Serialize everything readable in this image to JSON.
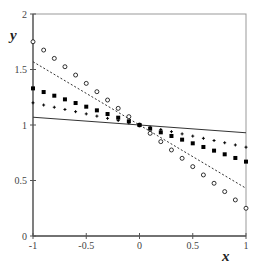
{
  "chart_data": {
    "type": "scatter",
    "title": "",
    "xlabel": "x",
    "ylabel": "y",
    "xlim": [
      -1,
      1
    ],
    "ylim": [
      0,
      2
    ],
    "grid": false,
    "legend": null,
    "x_ticks": [
      -1,
      -0.5,
      0,
      0.5,
      1
    ],
    "x_tick_labels": [
      "-1",
      "-0.5",
      "0",
      "0.5",
      "1"
    ],
    "y_ticks": [
      0,
      0.5,
      1,
      1.5,
      2
    ],
    "y_tick_labels": [
      "0",
      "0.5",
      "1",
      "1.5",
      "2"
    ],
    "x": [
      -1,
      -0.9,
      -0.8,
      -0.7,
      -0.6,
      -0.5,
      -0.4,
      -0.3,
      -0.2,
      -0.1,
      0,
      0.1,
      0.2,
      0.3,
      0.4,
      0.5,
      0.6,
      0.7,
      0.8,
      0.9,
      1
    ],
    "series": [
      {
        "name": "open-circles",
        "kind": "markers",
        "marker": "circle-open",
        "slope": -0.75,
        "intercept": 1,
        "values": [
          1.75,
          1.675,
          1.6,
          1.525,
          1.45,
          1.375,
          1.3,
          1.225,
          1.15,
          1.075,
          1.0,
          0.925,
          0.85,
          0.775,
          0.7,
          0.625,
          0.55,
          0.475,
          0.4,
          0.325,
          0.25
        ]
      },
      {
        "name": "filled-squares",
        "kind": "markers",
        "marker": "square-filled",
        "slope": -0.33,
        "intercept": 1,
        "values": [
          1.33,
          1.297,
          1.264,
          1.231,
          1.198,
          1.165,
          1.132,
          1.099,
          1.066,
          1.033,
          1.0,
          0.967,
          0.934,
          0.901,
          0.868,
          0.835,
          0.802,
          0.769,
          0.736,
          0.703,
          0.67
        ]
      },
      {
        "name": "plus-markers",
        "kind": "markers",
        "marker": "plus",
        "slope": -0.2,
        "intercept": 1,
        "values": [
          1.2,
          1.18,
          1.16,
          1.14,
          1.12,
          1.1,
          1.08,
          1.06,
          1.04,
          1.02,
          1.0,
          0.98,
          0.96,
          0.94,
          0.92,
          0.9,
          0.88,
          0.86,
          0.84,
          0.82,
          0.8
        ]
      },
      {
        "name": "dashed-line",
        "kind": "line",
        "style": "dashed",
        "slope": -0.57,
        "intercept": 1,
        "x": [
          -1,
          1
        ],
        "values": [
          1.57,
          0.43
        ]
      },
      {
        "name": "solid-line",
        "kind": "line",
        "style": "solid",
        "slope": -0.07,
        "intercept": 1,
        "x": [
          -1,
          1
        ],
        "values": [
          1.07,
          0.93
        ]
      }
    ]
  },
  "colors": {
    "axis": "#555555",
    "markers": "#000000",
    "lines": "#333333"
  }
}
